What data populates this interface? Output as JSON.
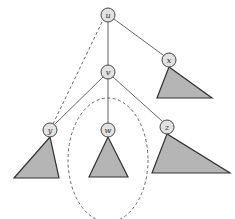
{
  "diagram": {
    "type": "tree",
    "nodes": [
      {
        "id": "u",
        "label": "u",
        "cx": 108,
        "cy": 15
      },
      {
        "id": "v",
        "label": "v",
        "cx": 108,
        "cy": 72
      },
      {
        "id": "x",
        "label": "x",
        "cx": 169,
        "cy": 60
      },
      {
        "id": "y",
        "label": "y",
        "cx": 50,
        "cy": 130
      },
      {
        "id": "w",
        "label": "w",
        "cx": 108,
        "cy": 130
      },
      {
        "id": "z",
        "label": "z",
        "cx": 167,
        "cy": 127
      }
    ],
    "edges": [
      {
        "from": "u",
        "to": "v",
        "style": "solid"
      },
      {
        "from": "u",
        "to": "x",
        "style": "solid"
      },
      {
        "from": "v",
        "to": "y",
        "style": "solid"
      },
      {
        "from": "v",
        "to": "w",
        "style": "solid"
      },
      {
        "from": "v",
        "to": "z",
        "style": "solid"
      },
      {
        "from": "u",
        "to": "y",
        "style": "dashed"
      }
    ],
    "subtrees": [
      {
        "root": "x",
        "shape": "triangle"
      },
      {
        "root": "y",
        "shape": "triangle"
      },
      {
        "root": "w",
        "shape": "triangle"
      },
      {
        "root": "z",
        "shape": "triangle"
      }
    ],
    "highlight": {
      "encloses": "w",
      "shape": "dashed-ellipse"
    },
    "colors": {
      "node_fill": "#e2e2e2",
      "subtree_fill": "#b5b5b5",
      "stroke": "#444444"
    }
  }
}
